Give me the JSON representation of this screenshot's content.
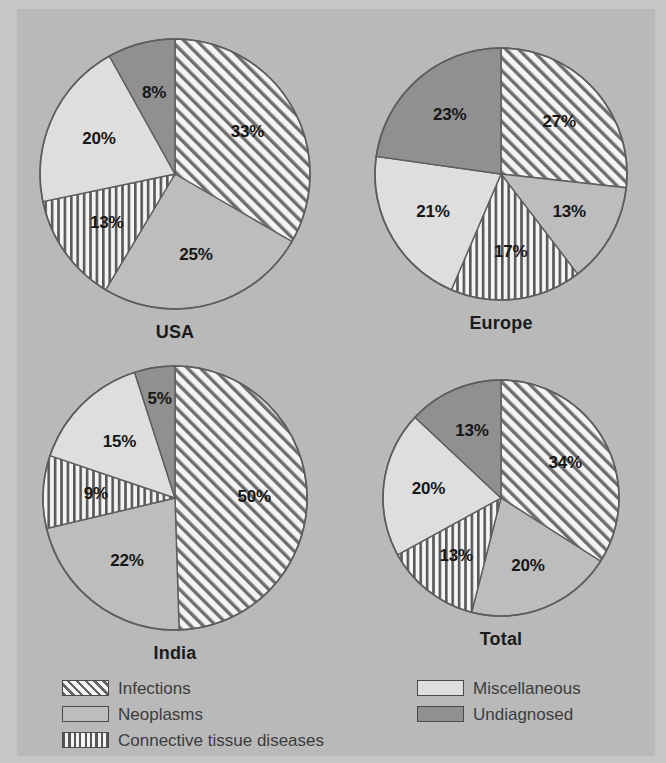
{
  "figure": {
    "background_color": "#b9b9b9",
    "frame_color": "#c6c6c6",
    "outline_color": "#4a4a4a"
  },
  "legend": {
    "left_column": [
      {
        "key": "infections",
        "label": "Infections",
        "pattern": "diagonal-hatch",
        "color": "#f2f2f2"
      },
      {
        "key": "neoplasms",
        "label": "Neoplasms",
        "pattern": "solid",
        "color": "#bdbdbd"
      },
      {
        "key": "connective",
        "label": "Connective tissue diseases",
        "pattern": "vertical-stripe",
        "color": "#f2f2f2"
      }
    ],
    "right_column": [
      {
        "key": "miscellaneous",
        "label": "Miscellaneous",
        "pattern": "solid",
        "color": "#dedede"
      },
      {
        "key": "undiagnosed",
        "label": "Undiagnosed",
        "pattern": "solid",
        "color": "#909090"
      }
    ]
  },
  "chart_data": [
    {
      "type": "pie",
      "title": "USA",
      "categories": [
        "Infections",
        "Neoplasms",
        "Connective tissue diseases",
        "Miscellaneous",
        "Undiagnosed"
      ],
      "values": [
        33,
        25,
        13,
        20,
        8
      ],
      "labels": [
        "33%",
        "25%",
        "13%",
        "20%",
        "8%"
      ],
      "start_angle_deg": 0,
      "direction": "clockwise",
      "units": "percent"
    },
    {
      "type": "pie",
      "title": "Europe",
      "categories": [
        "Infections",
        "Neoplasms",
        "Connective tissue diseases",
        "Miscellaneous",
        "Undiagnosed"
      ],
      "values": [
        27,
        13,
        17,
        21,
        23
      ],
      "labels": [
        "27%",
        "13%",
        "17%",
        "21%",
        "23%"
      ],
      "start_angle_deg": 0,
      "direction": "clockwise",
      "units": "percent"
    },
    {
      "type": "pie",
      "title": "India",
      "categories": [
        "Infections",
        "Neoplasms",
        "Connective tissue diseases",
        "Miscellaneous",
        "Undiagnosed"
      ],
      "values": [
        50,
        22,
        9,
        15,
        5
      ],
      "labels": [
        "50%",
        "22%",
        "9%",
        "15%",
        "5%"
      ],
      "start_angle_deg": 0,
      "direction": "clockwise",
      "units": "percent"
    },
    {
      "type": "pie",
      "title": "Total",
      "categories": [
        "Infections",
        "Neoplasms",
        "Connective tissue diseases",
        "Miscellaneous",
        "Undiagnosed"
      ],
      "values": [
        34,
        20,
        13,
        20,
        13
      ],
      "labels": [
        "34%",
        "20%",
        "13%",
        "20%",
        "13%"
      ],
      "start_angle_deg": 0,
      "direction": "clockwise",
      "units": "percent"
    }
  ],
  "pies": [
    {
      "name": "usa",
      "cx": 158,
      "cy": 165,
      "r": 135,
      "label_radius_ratio": 0.62,
      "title_offset": 150
    },
    {
      "name": "europe",
      "cx": 484,
      "cy": 165,
      "r": 126,
      "label_radius_ratio": 0.62,
      "title_offset": 141
    },
    {
      "name": "india",
      "cx": 158,
      "cy": 489,
      "r": 132,
      "label_radius_ratio": 0.6,
      "title_offset": 147
    },
    {
      "name": "total",
      "cx": 484,
      "cy": 489,
      "r": 118,
      "label_radius_ratio": 0.62,
      "title_offset": 133
    }
  ]
}
